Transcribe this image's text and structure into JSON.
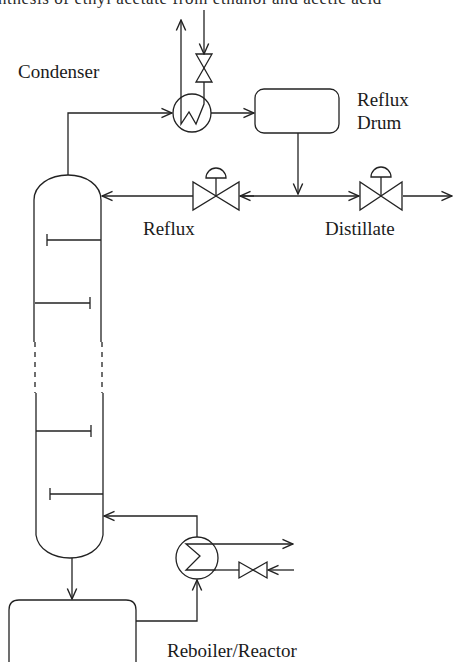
{
  "page": {
    "cropped_caption": "nthesis of ethyl acetate from ethanol and acetic acid"
  },
  "diagram": {
    "type": "process flow diagram - reactive distillation column",
    "labels": {
      "condenser": "Condenser",
      "reflux_drum_line1": "Reflux",
      "reflux_drum_line2": "Drum",
      "reflux": "Reflux",
      "distillate": "Distillate",
      "reboiler_reactor": "Reboiler/Reactor"
    },
    "components": [
      {
        "id": "column",
        "name": "Distillation column",
        "trays": 4
      },
      {
        "id": "condenser",
        "name": "Condenser heat exchanger"
      },
      {
        "id": "reflux-drum",
        "name": "Reflux drum"
      },
      {
        "id": "reflux-valve",
        "name": "Reflux control valve"
      },
      {
        "id": "distillate-valve",
        "name": "Distillate control valve"
      },
      {
        "id": "coolant-valve",
        "name": "Condenser coolant valve"
      },
      {
        "id": "reboiler",
        "name": "Reboiler heat exchanger"
      },
      {
        "id": "steam-valve",
        "name": "Reboiler heating valve"
      },
      {
        "id": "reactor",
        "name": "Reboiler/Reactor vessel"
      }
    ],
    "colors": {
      "line": "#222222",
      "background": "#ffffff"
    }
  }
}
